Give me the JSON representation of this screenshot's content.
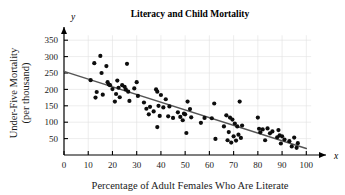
{
  "chart_data": {
    "type": "scatter",
    "title": "Literacy and Child Mortality",
    "xlabel": "Percentage of Adult Females Who Are Literate",
    "ylabel": "Under-Five Mortality (per thousand)",
    "ylabel_line1": "Under-Five Mortality",
    "ylabel_line2": "(per thousand)",
    "x_axis_letter": "x",
    "y_axis_letter": "y",
    "xlim": [
      0,
      104
    ],
    "ylim": [
      0,
      375
    ],
    "xticks": [
      0,
      10,
      20,
      30,
      40,
      50,
      60,
      70,
      80,
      90,
      100
    ],
    "yticks": [
      50,
      100,
      150,
      200,
      250,
      300,
      350
    ],
    "grid": true,
    "legend": null,
    "marker_color": "#0d0d0d",
    "line_color": "#555555",
    "grid_color": "#e0e0e0",
    "trendline": {
      "label": "least-squares regression line",
      "x": [
        0,
        100
      ],
      "y": [
        255,
        20
      ]
    },
    "points": [
      [
        11,
        228
      ],
      [
        12.5,
        280
      ],
      [
        13,
        175
      ],
      [
        13.5,
        192
      ],
      [
        15,
        302
      ],
      [
        15.5,
        250
      ],
      [
        16,
        184
      ],
      [
        17.5,
        271
      ],
      [
        18,
        222
      ],
      [
        18.5,
        215
      ],
      [
        19,
        213
      ],
      [
        20,
        201
      ],
      [
        21,
        163
      ],
      [
        21.5,
        186
      ],
      [
        22,
        227
      ],
      [
        22.5,
        205
      ],
      [
        23,
        176
      ],
      [
        24,
        213
      ],
      [
        25,
        208
      ],
      [
        25.5,
        200
      ],
      [
        26,
        278
      ],
      [
        26.5,
        193
      ],
      [
        27,
        165
      ],
      [
        29,
        203
      ],
      [
        30,
        222
      ],
      [
        30.5,
        180
      ],
      [
        33,
        160
      ],
      [
        34,
        141
      ],
      [
        35,
        124
      ],
      [
        35.5,
        147
      ],
      [
        37,
        133
      ],
      [
        38,
        200
      ],
      [
        38.5,
        193
      ],
      [
        38.5,
        85
      ],
      [
        39,
        150
      ],
      [
        39.5,
        119
      ],
      [
        40,
        183
      ],
      [
        41,
        145
      ],
      [
        42,
        170
      ],
      [
        43,
        118
      ],
      [
        43.5,
        148
      ],
      [
        45,
        113
      ],
      [
        47,
        130
      ],
      [
        48,
        116
      ],
      [
        49,
        106
      ],
      [
        49.5,
        126
      ],
      [
        50,
        124
      ],
      [
        50.5,
        67
      ],
      [
        51,
        163
      ],
      [
        52,
        140
      ],
      [
        52.5,
        115
      ],
      [
        56.5,
        98
      ],
      [
        58,
        113
      ],
      [
        61,
        112
      ],
      [
        62,
        157
      ],
      [
        62.5,
        49
      ],
      [
        66,
        87
      ],
      [
        67,
        121
      ],
      [
        67.5,
        45
      ],
      [
        68,
        70
      ],
      [
        68.5,
        114
      ],
      [
        69,
        38
      ],
      [
        69.5,
        108
      ],
      [
        70,
        57
      ],
      [
        70.5,
        96
      ],
      [
        71,
        44
      ],
      [
        71.5,
        87
      ],
      [
        72,
        62
      ],
      [
        72.5,
        163
      ],
      [
        73,
        52
      ],
      [
        73.5,
        90
      ],
      [
        80,
        114
      ],
      [
        80.5,
        80
      ],
      [
        81,
        69
      ],
      [
        82,
        78
      ],
      [
        83,
        45
      ],
      [
        84,
        81
      ],
      [
        85,
        66
      ],
      [
        86,
        72
      ],
      [
        88,
        54
      ],
      [
        88.5,
        76
      ],
      [
        89,
        60
      ],
      [
        89.5,
        35
      ],
      [
        90,
        57
      ],
      [
        91,
        47
      ],
      [
        93,
        42
      ],
      [
        94,
        26
      ],
      [
        95,
        53
      ],
      [
        96,
        22
      ],
      [
        96.5,
        36
      ]
    ]
  }
}
